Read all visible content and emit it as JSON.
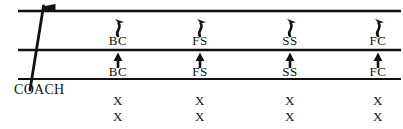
{
  "diagram": {
    "background_color": "#ffffff",
    "line_color": "#111111",
    "text_color": "#111111",
    "width": 403,
    "height": 129,
    "field_lines": [
      {
        "name": "top-yard-line",
        "y": 11,
        "x1": 18,
        "x2": 401
      },
      {
        "name": "middle-yard-line",
        "y": 50,
        "x1": 18,
        "x2": 401
      },
      {
        "name": "bottom-yard-line",
        "y": 79,
        "x1": 18,
        "x2": 401
      }
    ],
    "coach_line": {
      "x1": 43,
      "y1": 6,
      "x2": 30,
      "y2": 90
    },
    "coach_flag": {
      "x": 43,
      "y": 6,
      "label": "flag-marker"
    },
    "coach_label": {
      "text": "COACH",
      "x": 14,
      "y": 90
    },
    "columns": [
      {
        "id": "column-1",
        "x": 118,
        "upper_arrow": {
          "type": "squiggly-arrow-up",
          "x": 118,
          "y_top": 16,
          "y_bottom": 36
        },
        "upper_label": "BC",
        "lower_arrow": {
          "type": "straight-arrow-up",
          "x": 118,
          "y_top": 55,
          "y_bottom": 68
        },
        "lower_label": "BC",
        "x_marks": [
          "X",
          "X"
        ]
      },
      {
        "id": "column-2",
        "x": 200,
        "upper_arrow": {
          "type": "squiggly-arrow-up",
          "x": 200,
          "y_top": 16,
          "y_bottom": 36
        },
        "upper_label": "FS",
        "lower_arrow": {
          "type": "straight-arrow-up",
          "x": 200,
          "y_top": 55,
          "y_bottom": 68
        },
        "lower_label": "FS",
        "x_marks": [
          "X",
          "X"
        ]
      },
      {
        "id": "column-3",
        "x": 290,
        "upper_arrow": {
          "type": "squiggly-arrow-up",
          "x": 290,
          "y_top": 16,
          "y_bottom": 36
        },
        "upper_label": "SS",
        "lower_arrow": {
          "type": "straight-arrow-up",
          "x": 290,
          "y_top": 55,
          "y_bottom": 68
        },
        "lower_label": "SS",
        "x_marks": [
          "X",
          "X"
        ]
      },
      {
        "id": "column-4",
        "x": 378,
        "upper_arrow": {
          "type": "squiggly-arrow-up",
          "x": 378,
          "y_top": 16,
          "y_bottom": 36
        },
        "upper_label": "FC",
        "lower_arrow": {
          "type": "straight-arrow-up",
          "x": 378,
          "y_top": 55,
          "y_bottom": 68
        },
        "lower_label": "FC",
        "x_marks": [
          "X",
          "X"
        ]
      }
    ],
    "x_row_y": [
      101,
      117
    ]
  }
}
